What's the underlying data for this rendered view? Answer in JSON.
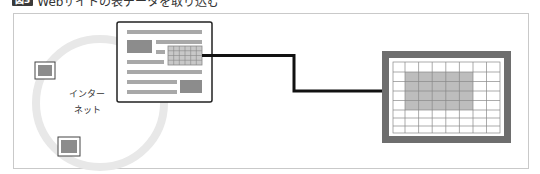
{
  "caption": {
    "badge": "図3",
    "title": "Webサイトの表データを取り込む"
  },
  "internet": {
    "label_line1": "インター",
    "label_line2": "ネット",
    "ring_color": "#e6e6e6",
    "nodes": [
      {
        "name": "remote-computer-1",
        "x": 35,
        "y": 62,
        "w": 20,
        "h": 17
      },
      {
        "name": "remote-computer-2",
        "x": 58,
        "y": 137,
        "w": 22,
        "h": 19
      }
    ]
  },
  "webpage": {
    "label": "Webページ",
    "table": {
      "cols": 6,
      "rows": 4
    }
  },
  "spreadsheet": {
    "label": "表計算シート",
    "cols": 9,
    "rows": 8,
    "highlight": {
      "col_start": 1,
      "col_end": 5,
      "row_start": 1,
      "row_end": 4
    },
    "frame_color": "#6e6e6e",
    "highlight_color": "#bdbdbd"
  },
  "colors": {
    "gray_block": "#8c8c8c",
    "gray_line": "#a8a8a8",
    "arrow": "#111111",
    "border": "#333333"
  }
}
